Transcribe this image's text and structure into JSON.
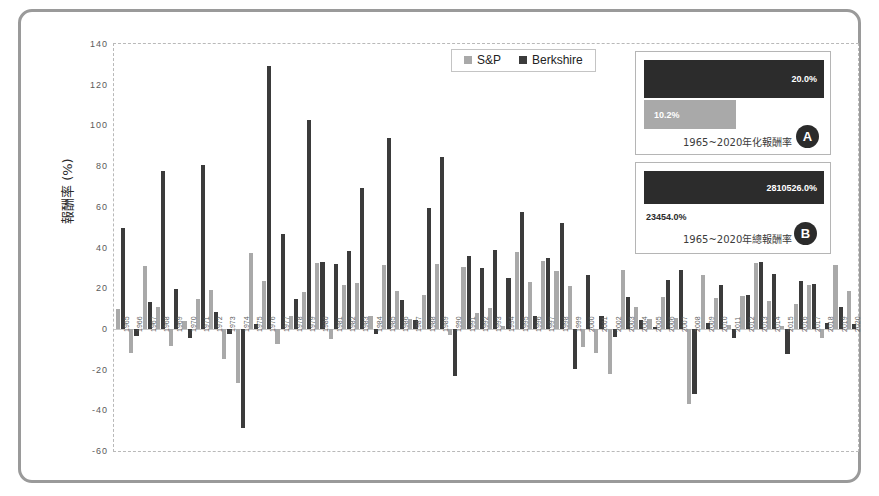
{
  "legend": {
    "items": [
      {
        "label": "S&P",
        "color": "#a9a9a9"
      },
      {
        "label": "Berkshire",
        "color": "#3b3b3b"
      }
    ]
  },
  "axes": {
    "y_title": "報酬率 (%)",
    "y_ticks": [
      "140",
      "120",
      "100",
      "80",
      "60",
      "40",
      "20",
      "0",
      "-20",
      "-40",
      "-60"
    ]
  },
  "insets": {
    "a": {
      "badge": "A",
      "caption": "1965~2020年化報酬率",
      "berkshire_value": "20.0%",
      "sp_value": "10.2%"
    },
    "b": {
      "badge": "B",
      "caption": "1965~2020年總報酬率",
      "berkshire_value": "2810526.0%",
      "sp_value": "23454.0%"
    }
  },
  "chart_data": {
    "type": "bar",
    "title": "",
    "xlabel": "",
    "ylabel": "報酬率 (%)",
    "ylim": [
      -60,
      140
    ],
    "ytick_step": 20,
    "grid": false,
    "legend_position": "top-center",
    "categories": [
      "1965",
      "1966",
      "1967",
      "1968",
      "1969",
      "1970",
      "1971",
      "1972",
      "1973",
      "1974",
      "1975",
      "1976",
      "1977",
      "1978",
      "1979",
      "1980",
      "1981",
      "1982",
      "1983",
      "1984",
      "1985",
      "1986",
      "1987",
      "1988",
      "1989",
      "1990",
      "1991",
      "1992",
      "1993",
      "1994",
      "1995",
      "1996",
      "1997",
      "1998",
      "1999",
      "2000",
      "2001",
      "2002",
      "2003",
      "2004",
      "2005",
      "2006",
      "2007",
      "2008",
      "2009",
      "2010",
      "2011",
      "2012",
      "2013",
      "2014",
      "2015",
      "2016",
      "2017",
      "2018",
      "2019",
      "2020"
    ],
    "series": [
      {
        "name": "S&P",
        "color": "#a9a9a9",
        "values": [
          10.0,
          -11.7,
          30.9,
          11.0,
          -8.4,
          3.9,
          14.6,
          18.9,
          -14.8,
          -26.4,
          37.2,
          23.6,
          -7.4,
          6.4,
          18.2,
          32.3,
          -5.0,
          21.4,
          22.4,
          6.1,
          31.6,
          18.6,
          5.1,
          16.6,
          31.7,
          -3.1,
          30.5,
          7.6,
          10.1,
          1.3,
          37.6,
          23.0,
          33.4,
          28.6,
          21.0,
          -9.1,
          -11.9,
          -22.1,
          28.7,
          10.9,
          4.9,
          15.8,
          5.5,
          -37.0,
          26.5,
          15.1,
          2.1,
          16.0,
          32.4,
          13.7,
          1.4,
          12.0,
          21.8,
          -4.4,
          31.5,
          18.4
        ]
      },
      {
        "name": "Berkshire",
        "color": "#3b3b3b",
        "values": [
          49.5,
          -3.4,
          13.3,
          77.8,
          19.4,
          -4.6,
          80.5,
          8.1,
          -2.5,
          -48.7,
          2.5,
          129.3,
          46.8,
          14.5,
          102.5,
          32.8,
          31.8,
          38.4,
          69.0,
          -2.7,
          93.7,
          14.2,
          4.6,
          59.3,
          84.6,
          -23.1,
          35.6,
          29.8,
          38.9,
          25.0,
          57.4,
          6.2,
          34.9,
          52.2,
          -19.9,
          26.6,
          6.5,
          -3.8,
          15.8,
          4.3,
          0.8,
          24.1,
          28.7,
          -31.8,
          2.7,
          21.4,
          -4.7,
          16.8,
          32.7,
          27.0,
          -12.5,
          23.4,
          21.9,
          2.8,
          11.0,
          2.4
        ]
      }
    ]
  }
}
